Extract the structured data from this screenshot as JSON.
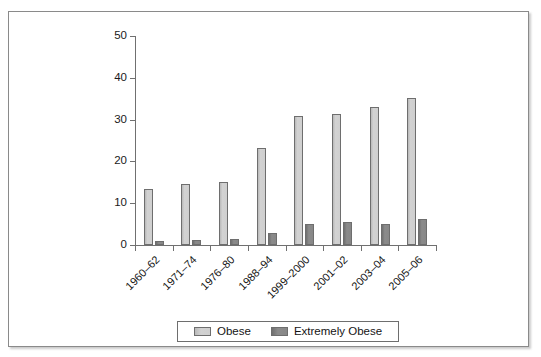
{
  "chart_data": {
    "type": "bar",
    "title": "",
    "xlabel": "",
    "ylabel": "",
    "ylim": [
      0,
      50
    ],
    "ytick_values": [
      0,
      10,
      20,
      30,
      40,
      50
    ],
    "ytick_labels": [
      "0",
      "10",
      "20",
      "30",
      "40",
      "50"
    ],
    "grid": false,
    "legend_position": "bottom",
    "categories": [
      "1960–62",
      "1971–74",
      "1976–80",
      "1988–94",
      "1999–2000",
      "2001–02",
      "2003–04",
      "2005–06"
    ],
    "series": [
      {
        "name": "Obese",
        "color": "#cfcfcf",
        "values": [
          13.4,
          14.5,
          15.0,
          23.2,
          30.9,
          31.3,
          32.9,
          35.1
        ]
      },
      {
        "name": "Extremely Obese",
        "color": "#878787",
        "values": [
          0.9,
          1.3,
          1.4,
          2.9,
          5.0,
          5.4,
          5.1,
          6.2
        ]
      }
    ]
  },
  "legend": {
    "entries": [
      {
        "label": "Obese"
      },
      {
        "label": "Extremely Obese"
      }
    ]
  }
}
